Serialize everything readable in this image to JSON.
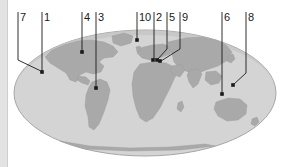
{
  "figure": {
    "caption": "",
    "colors": {
      "ocean": "#d4d4d4",
      "ocean_edge": "#bdbdbd",
      "land": "#a9a9a9",
      "outline": "#8f8f8f",
      "leader_line": "#1a1a1a",
      "label_text": "#1a1a1a",
      "background": "#ffffff",
      "left_strip": "#e3e3e3"
    },
    "globe": {
      "shape": "ellipse",
      "center_x": 145,
      "center_y": 93,
      "radius_x": 131,
      "radius_y": 63
    }
  },
  "callouts": [
    {
      "id": "callout-7",
      "label": "7",
      "label_x": 20,
      "label_y": 12,
      "tick_x": 18,
      "path": "M18,12 L18,60 L43,72",
      "dot": false
    },
    {
      "id": "callout-1",
      "label": "1",
      "label_x": 44,
      "label_y": 12,
      "tick_x": 42,
      "path": "M42,12 L42,71",
      "dot": true,
      "dot_x": 42,
      "dot_y": 72
    },
    {
      "id": "callout-4",
      "label": "4",
      "label_x": 84,
      "label_y": 12,
      "tick_x": 82,
      "path": "M82,12 L82,51",
      "dot": true,
      "dot_x": 82,
      "dot_y": 52
    },
    {
      "id": "callout-3",
      "label": "3",
      "label_x": 98,
      "label_y": 12,
      "tick_x": 96,
      "path": "M96,12 L96,87",
      "dot": true,
      "dot_x": 96,
      "dot_y": 88
    },
    {
      "id": "callout-10",
      "label": "10",
      "label_x": 139,
      "label_y": 12,
      "tick_x": 137,
      "path": "M137,12 L137,39",
      "dot": true,
      "dot_x": 137,
      "dot_y": 40
    },
    {
      "id": "callout-2",
      "label": "2",
      "label_x": 156,
      "label_y": 12,
      "tick_x": 154,
      "path": "M154,12 L154,59",
      "dot": true,
      "dot_x": 153,
      "dot_y": 60
    },
    {
      "id": "callout-5",
      "label": "5",
      "label_x": 169,
      "label_y": 12,
      "tick_x": 167,
      "path": "M167,12 L167,49 L157,60",
      "dot": true,
      "dot_x": 157,
      "dot_y": 60
    },
    {
      "id": "callout-9",
      "label": "9",
      "label_x": 182,
      "label_y": 12,
      "tick_x": 180,
      "path": "M180,12 L180,49 L161,61",
      "dot": true,
      "dot_x": 160,
      "dot_y": 61
    },
    {
      "id": "callout-6",
      "label": "6",
      "label_x": 224,
      "label_y": 12,
      "tick_x": 222,
      "path": "M222,12 L222,93",
      "dot": true,
      "dot_x": 222,
      "dot_y": 94
    },
    {
      "id": "callout-8",
      "label": "8",
      "label_x": 248,
      "label_y": 12,
      "tick_x": 246,
      "path": "M246,12 L246,73 L233,85",
      "dot": true,
      "dot_x": 233,
      "dot_y": 85
    }
  ],
  "landmasses": [
    {
      "name": "north-america",
      "d": "M45,57 L52,50 L64,45 L78,41 L92,40 L104,42 L113,46 L118,52 L113,57 L104,58 L99,62 L104,66 L101,72 L93,74 L86,72 L80,75 L76,82 L70,80 L66,73 L58,68 L50,63 Z"
    },
    {
      "name": "greenland",
      "d": "M112,36 L124,33 L133,36 L131,43 L121,46 L113,43 Z"
    },
    {
      "name": "south-america",
      "d": "M92,82 L100,79 L107,82 L110,90 L108,100 L104,112 L99,124 L94,130 L89,127 L88,117 L85,106 L86,95 L89,87 Z"
    },
    {
      "name": "central-america",
      "d": "M78,76 L86,77 L90,81 L88,85 L82,83 L77,80 Z"
    },
    {
      "name": "africa",
      "d": "M140,64 L153,62 L166,63 L174,67 L176,75 L171,86 L166,96 L160,108 L153,118 L146,122 L140,118 L136,108 L133,96 L132,84 L134,72 Z"
    },
    {
      "name": "europe",
      "d": "M140,48 L152,45 L163,44 L172,47 L170,54 L160,58 L150,60 L142,58 L137,53 Z"
    },
    {
      "name": "asia",
      "d": "M168,42 L185,38 L202,37 L216,40 L226,45 L232,52 L228,60 L218,66 L206,70 L196,74 L188,72 L180,68 L174,62 L172,54 L169,48 Z"
    },
    {
      "name": "india",
      "d": "M190,70 L198,69 L202,74 L198,84 L193,88 L189,82 L187,75 Z"
    },
    {
      "name": "southeast-asia",
      "d": "M206,72 L216,71 L222,76 L219,83 L211,85 L205,80 Z"
    },
    {
      "name": "australia",
      "d": "M216,102 L228,98 L240,99 L247,105 L246,114 L238,120 L227,121 L218,116 L214,109 Z"
    },
    {
      "name": "new-zealand",
      "d": "M252,119 L257,117 L259,122 L255,126 L251,124 Z"
    },
    {
      "name": "antarctica-hint",
      "d": "M60,141 L90,146 L130,148 L170,147 L205,144 L215,146 L180,150 L130,151 L85,149 Z"
    },
    {
      "name": "japan",
      "d": "M228,56 L233,54 L235,59 L231,63 L227,61 Z"
    },
    {
      "name": "madagascar",
      "d": "M178,103 L182,101 L184,107 L181,112 L177,109 Z"
    },
    {
      "name": "uk",
      "d": "M136,47 L140,46 L141,50 L137,52 Z"
    },
    {
      "name": "arabia",
      "d": "M172,66 L181,64 L185,70 L180,77 L174,75 L170,70 Z"
    }
  ]
}
